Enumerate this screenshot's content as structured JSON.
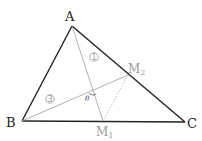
{
  "diagram": {
    "vertices": {
      "A": {
        "label": "A"
      },
      "B": {
        "label": "B"
      },
      "C": {
        "label": "C"
      }
    },
    "midpoints": {
      "M1": {
        "label": "M",
        "subscript": "1",
        "description": "midpoint of BC"
      },
      "M2": {
        "label": "M",
        "subscript": "2",
        "description": "midpoint of AC"
      }
    },
    "segment_labels": {
      "median_A": "1",
      "median_B": "3"
    },
    "angle_label": "θ",
    "colors": {
      "triangle": "#222222",
      "medians": "#a8a8a8",
      "midline": "#b8b8b8",
      "labels_muted": "#9a9a9a"
    }
  }
}
